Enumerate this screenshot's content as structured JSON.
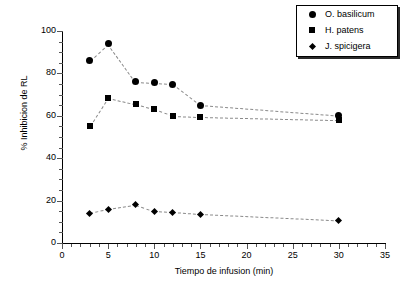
{
  "chart_data": {
    "type": "scatter",
    "title": "",
    "xlabel": "Tiempo de infusion (min)",
    "ylabel": "% Inhibicion de RL",
    "xlim": [
      0,
      35
    ],
    "ylim": [
      0,
      100
    ],
    "xticks": [
      0,
      5,
      10,
      15,
      20,
      25,
      30,
      35
    ],
    "xtick_labels": [
      "0",
      "5",
      "10",
      "15",
      "20",
      "25",
      "30",
      "35"
    ],
    "yticks": [
      0,
      20,
      40,
      60,
      80,
      100
    ],
    "ytick_labels": [
      "0",
      "20",
      "40",
      "60",
      "80",
      "100"
    ],
    "grid": false,
    "legend_position": "top-right",
    "x": [
      3,
      5,
      8,
      10,
      12,
      15,
      30
    ],
    "series": [
      {
        "name": "O. basilicum",
        "marker": "circle",
        "color": "#000000",
        "values": [
          86,
          94,
          76,
          75.5,
          75,
          65,
          60
        ]
      },
      {
        "name": "H. patens",
        "marker": "square",
        "color": "#000000",
        "values": [
          55,
          68.5,
          65.5,
          63,
          60,
          59.5,
          58
        ]
      },
      {
        "name": "J. spicigera",
        "marker": "diamond",
        "color": "#000000",
        "values": [
          14,
          16,
          18,
          15,
          14.5,
          13.5,
          10.5
        ]
      }
    ]
  }
}
